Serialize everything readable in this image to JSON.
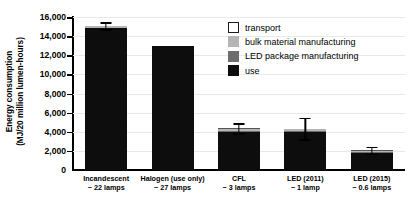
{
  "chart_data": {
    "type": "bar",
    "title": "",
    "subtitle": "",
    "xlabel": "",
    "ylabel": "Energy consumption",
    "ylabel_line2": "(MJ/20 million lumen-hours)",
    "ylim": [
      0,
      16000
    ],
    "ytick_values": [
      0,
      2000,
      4000,
      6000,
      8000,
      10000,
      12000,
      14000,
      16000
    ],
    "ytick_labels": [
      "0",
      "2,000",
      "4,000",
      "6,000",
      "8,000",
      "10,000",
      "12,000",
      "14,000",
      "16,000"
    ],
    "grid": true,
    "grid_axis": "y",
    "legend_position": "upper right inside",
    "stacked": true,
    "categories": [
      "Incandescent",
      "Halogen (use only)",
      "CFL",
      "LED (2011)",
      "LED (2015)"
    ],
    "category_sublabels": [
      "~ 22 lamps",
      "~ 27 lamps",
      "~ 3 lamps",
      "~ 1 lamp",
      "~ 0.6 lamps"
    ],
    "series": [
      {
        "name": "use",
        "color": "#0d0d0d",
        "values": [
          14850,
          13000,
          4000,
          3950,
          1800
        ]
      },
      {
        "name": "LED package manufacturing",
        "color": "#6e6e6e",
        "values": [
          0,
          0,
          120,
          180,
          110
        ]
      },
      {
        "name": "bulk material manufacturing",
        "color": "#b5b5b5",
        "values": [
          180,
          0,
          180,
          160,
          120
        ]
      },
      {
        "name": "transport",
        "color": "#ffffff",
        "values": [
          60,
          0,
          60,
          50,
          40
        ]
      }
    ],
    "totals": [
      15090,
      13000,
      4360,
      4340,
      2070
    ],
    "error_bars": [
      {
        "category": "Incandescent",
        "total": 15090,
        "upper": 15450,
        "lower": 14730
      },
      {
        "category": "Halogen (use only)",
        "total": 13000,
        "upper": 13000,
        "lower": 13000
      },
      {
        "category": "CFL",
        "total": 4360,
        "upper": 4900,
        "lower": 3820
      },
      {
        "category": "LED (2011)",
        "total": 4340,
        "upper": 5450,
        "lower": 3230
      },
      {
        "category": "LED (2015)",
        "total": 2070,
        "upper": 2450,
        "lower": 1690
      }
    ]
  },
  "legend": {
    "items": [
      {
        "label": "transport",
        "color": "#ffffff"
      },
      {
        "label": "bulk material manufacturing",
        "color": "#b5b5b5"
      },
      {
        "label": "LED package manufacturing",
        "color": "#6e6e6e"
      },
      {
        "label": "use",
        "color": "#0d0d0d"
      }
    ]
  },
  "axis": {
    "y_title_line1": "Energy consumption",
    "y_title_line2": "(MJ/20 million lumen-hours)"
  }
}
